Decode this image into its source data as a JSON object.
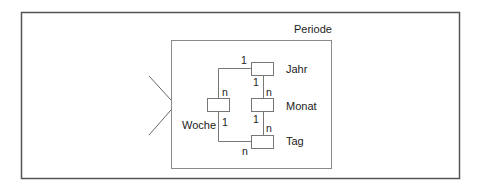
{
  "diagram": {
    "title": "Periode",
    "entities": [
      {
        "id": "jahr",
        "label": "Jahr"
      },
      {
        "id": "monat",
        "label": "Monat"
      },
      {
        "id": "woche",
        "label": "Woche"
      },
      {
        "id": "tag",
        "label": "Tag"
      }
    ],
    "relationships": [
      {
        "from": "jahr",
        "to": "woche",
        "from_card": "1",
        "to_card": "n"
      },
      {
        "from": "jahr",
        "to": "monat",
        "from_card": "1",
        "to_card": "n"
      },
      {
        "from": "monat",
        "to": "tag",
        "from_card": "1",
        "to_card": "n"
      },
      {
        "from": "woche",
        "to": "tag",
        "from_card": "1",
        "to_card": "n"
      }
    ]
  },
  "colors": {
    "frame": "#555555",
    "inner_frame": "#888888",
    "line": "#666666",
    "text": "#222222"
  }
}
